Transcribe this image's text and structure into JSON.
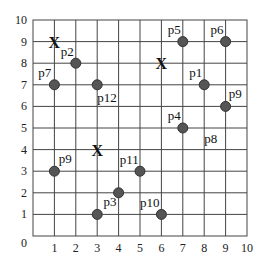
{
  "chart_data": {
    "type": "scatter",
    "title": "",
    "xlabel": "",
    "ylabel": "",
    "xlim": [
      0,
      10
    ],
    "ylim": [
      0,
      10
    ],
    "grid": true,
    "x_ticks": [
      "0",
      "1",
      "2",
      "3",
      "4",
      "5",
      "6",
      "7",
      "8",
      "9",
      "10"
    ],
    "y_ticks": [
      "1",
      "2",
      "3",
      "4",
      "5",
      "6",
      "7",
      "8",
      "9",
      "10"
    ],
    "origin_label": "0",
    "points": [
      {
        "label": "p1",
        "x": 8,
        "y": 7,
        "lx": 7.3,
        "ly": 7.35
      },
      {
        "label": "p2",
        "x": 2,
        "y": 8,
        "lx": 1.3,
        "ly": 8.35
      },
      {
        "label": "p3",
        "x": 3,
        "y": 1,
        "lx": 3.3,
        "ly": 1.4
      },
      {
        "label": "p4",
        "x": 7,
        "y": 5,
        "lx": 6.3,
        "ly": 5.35
      },
      {
        "label": "p5",
        "x": 7,
        "y": 9,
        "lx": 6.3,
        "ly": 9.35
      },
      {
        "label": "p6",
        "x": 9,
        "y": 9,
        "lx": 8.3,
        "ly": 9.35
      },
      {
        "label": "p7",
        "x": 1,
        "y": 7,
        "lx": 0.25,
        "ly": 7.35
      },
      {
        "label": "p9",
        "x": 9,
        "y": 6,
        "lx": 9.15,
        "ly": 6.4
      },
      {
        "label": "p9",
        "x": 1,
        "y": 3,
        "lx": 1.2,
        "ly": 3.4
      },
      {
        "label": "p10",
        "x": 6,
        "y": 1,
        "lx": 5.0,
        "ly": 1.35
      },
      {
        "label": "p11",
        "x": 5,
        "y": 3,
        "lx": 4.05,
        "ly": 3.35
      },
      {
        "label": "p12",
        "x": 3,
        "y": 7,
        "lx": 3.0,
        "ly": 6.2
      },
      {
        "label": "",
        "x": 4,
        "y": 2,
        "lx": 4,
        "ly": 2
      }
    ],
    "text_labels": [
      {
        "label": "p8",
        "x": 8.0,
        "y": 4.3
      }
    ],
    "centroids": [
      {
        "marker": "X",
        "x": 1,
        "y": 9
      },
      {
        "marker": "X",
        "x": 6,
        "y": 8
      },
      {
        "marker": "X",
        "x": 3,
        "y": 4
      }
    ],
    "colors": {
      "point": "#555555",
      "point_edge": "#333333",
      "grid": "#444444",
      "text": "#111111"
    }
  }
}
